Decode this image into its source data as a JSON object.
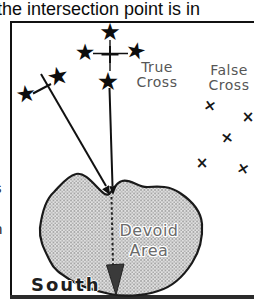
{
  "caption": "the intersection point is in",
  "icons": {
    "star": "★",
    "x_mark": "×"
  },
  "labels": {
    "true_cross": {
      "line1": "True",
      "line2": "Cross"
    },
    "false_cross": {
      "line1": "False",
      "line2": "Cross"
    },
    "devoid_area": {
      "line1": "Devoid",
      "line2": "Area"
    },
    "south": "South"
  },
  "margin_text": {
    "letter_top": "s",
    "letter_bottom": "n"
  },
  "colors": {
    "ink": "#111111",
    "label_gray": "#565656",
    "blob_fill_light": "#e2e2e2",
    "blob_dot": "#9b9b9b",
    "blob_stroke": "#1a1a1a",
    "arrowhead_dark": "#3a3a3a"
  }
}
